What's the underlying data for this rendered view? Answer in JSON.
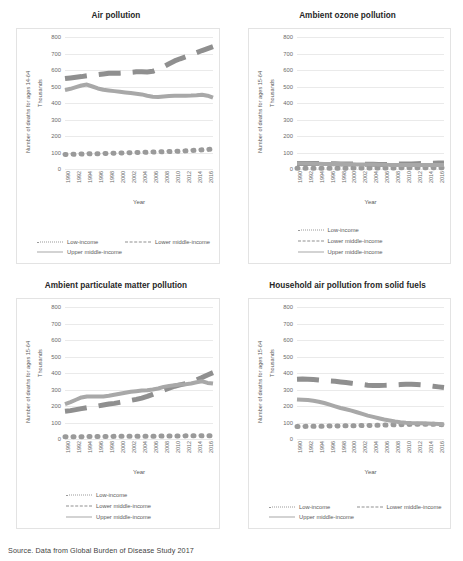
{
  "source_note": "Source. Data from Global Burden of Disease Study 2017",
  "common": {
    "xlabel": "Year",
    "y_units": "Thousands",
    "years": [
      1990,
      1991,
      1992,
      1993,
      1994,
      1995,
      1996,
      1997,
      1998,
      1999,
      2000,
      2001,
      2002,
      2003,
      2004,
      2005,
      2006,
      2007,
      2008,
      2009,
      2010,
      2011,
      2012,
      2013,
      2014,
      2015,
      2016,
      2017
    ],
    "xtick_labels": [
      "1990",
      "1992",
      "1994",
      "1996",
      "1998",
      "2000",
      "2002",
      "2004",
      "2006",
      "2008",
      "2010",
      "2012",
      "2014",
      "2016"
    ],
    "ytick_labels": [
      "800",
      "700",
      "600",
      "500",
      "400",
      "300",
      "200",
      "100",
      "0"
    ],
    "legend": {
      "low": "Low-income",
      "lower_middle": "Lower middle-income",
      "upper_middle": "Upper middle-income"
    },
    "colors": {
      "low_income": "#9a9a9a",
      "lower_middle_income": "#8f8f8f",
      "upper_middle_income": "#a8a8a8",
      "gridline": "#eaeaea",
      "panel_border": "#e3e3e3",
      "title_text": "#262626",
      "axis_text": "#6a6a6a"
    }
  },
  "chart_data": [
    {
      "id": "air-pollution",
      "type": "line",
      "title": "Air pollution",
      "ylabel": "Number of deaths for ages 14-64",
      "y_units": "Thousands",
      "xlabel": "Year",
      "ylim": [
        0,
        800
      ],
      "grid": true,
      "legend_position": "bottom-wide",
      "x": [
        1990,
        1991,
        1992,
        1993,
        1994,
        1995,
        1996,
        1997,
        1998,
        1999,
        2000,
        2001,
        2002,
        2003,
        2004,
        2005,
        2006,
        2007,
        2008,
        2009,
        2010,
        2011,
        2012,
        2013,
        2014,
        2015,
        2016,
        2017
      ],
      "series": [
        {
          "name": "Low-income",
          "style": "dotted",
          "values": [
            88,
            89,
            90,
            91,
            92,
            93,
            93,
            94,
            95,
            96,
            97,
            98,
            99,
            100,
            101,
            102,
            103,
            104,
            105,
            106,
            107,
            108,
            110,
            112,
            114,
            116,
            118,
            122
          ]
        },
        {
          "name": "Lower middle-income",
          "style": "dashed",
          "values": [
            548,
            552,
            556,
            560,
            565,
            568,
            572,
            576,
            580,
            580,
            581,
            583,
            586,
            589,
            590,
            588,
            592,
            605,
            620,
            638,
            655,
            668,
            680,
            692,
            705,
            718,
            730,
            742
          ]
        },
        {
          "name": "Upper middle-income",
          "style": "solid",
          "values": [
            478,
            486,
            496,
            506,
            512,
            500,
            488,
            480,
            476,
            472,
            468,
            464,
            460,
            456,
            452,
            444,
            438,
            436,
            440,
            442,
            444,
            444,
            444,
            445,
            447,
            450,
            444,
            432
          ]
        }
      ]
    },
    {
      "id": "ambient-ozone-pollution",
      "type": "line",
      "title": "Ambient ozone pollution",
      "ylabel": "Number of deaths for ages 15-64",
      "y_units": "Thousands",
      "xlabel": "Year",
      "ylim": [
        0,
        800
      ],
      "grid": true,
      "legend_position": "bottom-stacked",
      "x": [
        1990,
        1991,
        1992,
        1993,
        1994,
        1995,
        1996,
        1997,
        1998,
        1999,
        2000,
        2001,
        2002,
        2003,
        2004,
        2005,
        2006,
        2007,
        2008,
        2009,
        2010,
        2011,
        2012,
        2013,
        2014,
        2015,
        2016,
        2017
      ],
      "series": [
        {
          "name": "Low-income",
          "style": "dotted",
          "values": [
            5,
            5,
            5,
            5,
            5,
            5,
            5,
            5,
            5,
            5,
            6,
            6,
            6,
            6,
            6,
            6,
            6,
            6,
            6,
            7,
            7,
            7,
            7,
            7,
            7,
            8,
            8,
            8
          ]
        },
        {
          "name": "Lower middle-income",
          "style": "dashed",
          "values": [
            34,
            34,
            34,
            33,
            33,
            33,
            32,
            32,
            31,
            31,
            30,
            30,
            29,
            29,
            29,
            28,
            28,
            28,
            29,
            30,
            31,
            31,
            32,
            33,
            34,
            35,
            36,
            37
          ]
        },
        {
          "name": "Upper middle-income",
          "style": "solid",
          "values": [
            33,
            33,
            33,
            32,
            32,
            31,
            31,
            30,
            30,
            29,
            29,
            28,
            28,
            27,
            27,
            26,
            26,
            25,
            25,
            25,
            24,
            24,
            24,
            24,
            24,
            24,
            24,
            24
          ]
        }
      ]
    },
    {
      "id": "ambient-particulate-matter-pollution",
      "type": "line",
      "title": "Ambient particulate matter pollution",
      "ylabel": "Number of deaths for ages 15-64",
      "y_units": "Thousands",
      "xlabel": "Year",
      "ylim": [
        0,
        800
      ],
      "grid": true,
      "legend_position": "bottom-stacked",
      "x": [
        1990,
        1991,
        1992,
        1993,
        1994,
        1995,
        1996,
        1997,
        1998,
        1999,
        2000,
        2001,
        2002,
        2003,
        2004,
        2005,
        2006,
        2007,
        2008,
        2009,
        2010,
        2011,
        2012,
        2013,
        2014,
        2015,
        2016,
        2017
      ],
      "series": [
        {
          "name": "Low-income",
          "style": "dotted",
          "values": [
            14,
            14,
            14,
            14,
            15,
            15,
            15,
            15,
            15,
            16,
            16,
            16,
            16,
            16,
            17,
            17,
            17,
            17,
            18,
            18,
            18,
            18,
            19,
            19,
            19,
            20,
            20,
            20
          ]
        },
        {
          "name": "Lower middle-income",
          "style": "dashed",
          "values": [
            168,
            172,
            178,
            184,
            190,
            196,
            200,
            206,
            212,
            216,
            222,
            228,
            234,
            240,
            248,
            258,
            270,
            282,
            296,
            308,
            320,
            328,
            336,
            346,
            358,
            372,
            388,
            402
          ]
        },
        {
          "name": "Upper middle-income",
          "style": "solid",
          "values": [
            212,
            224,
            238,
            252,
            258,
            258,
            258,
            258,
            262,
            268,
            274,
            280,
            286,
            290,
            294,
            296,
            300,
            306,
            316,
            322,
            326,
            330,
            332,
            336,
            344,
            350,
            340,
            336
          ]
        }
      ]
    },
    {
      "id": "household-air-pollution-solid-fuels",
      "type": "line",
      "title": "Household air pollution from solid fuels",
      "ylabel": "Number of deaths for ages 15-64",
      "y_units": "Thousands",
      "xlabel": "Year",
      "ylim": [
        0,
        800
      ],
      "grid": true,
      "legend_position": "bottom-wide",
      "x": [
        1990,
        1991,
        1992,
        1993,
        1994,
        1995,
        1996,
        1997,
        1998,
        1999,
        2000,
        2001,
        2002,
        2003,
        2004,
        2005,
        2006,
        2007,
        2008,
        2009,
        2010,
        2011,
        2012,
        2013,
        2014,
        2015,
        2016,
        2017
      ],
      "series": [
        {
          "name": "Low-income",
          "style": "dotted",
          "values": [
            76,
            76,
            77,
            77,
            78,
            78,
            79,
            79,
            80,
            80,
            81,
            81,
            82,
            82,
            83,
            83,
            84,
            85,
            86,
            87,
            88,
            89,
            90,
            90,
            90,
            89,
            88,
            86
          ]
        },
        {
          "name": "Lower middle-income",
          "style": "dashed",
          "values": [
            362,
            363,
            362,
            360,
            357,
            354,
            352,
            350,
            346,
            342,
            338,
            334,
            330,
            326,
            324,
            324,
            325,
            326,
            328,
            330,
            332,
            332,
            330,
            328,
            324,
            320,
            316,
            312
          ]
        },
        {
          "name": "Upper middle-income",
          "style": "solid",
          "values": [
            240,
            238,
            236,
            232,
            226,
            218,
            208,
            198,
            188,
            180,
            172,
            162,
            152,
            142,
            134,
            126,
            118,
            112,
            106,
            102,
            99,
            97,
            96,
            95,
            94,
            93,
            91,
            88
          ]
        }
      ]
    }
  ]
}
